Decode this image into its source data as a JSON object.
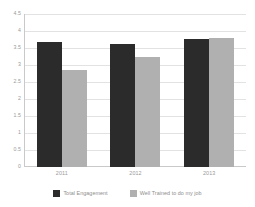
{
  "chart_data": {
    "type": "bar",
    "title": "",
    "subtitle": "",
    "xlabel": "",
    "ylabel": "",
    "categories": [
      "2011",
      "2012",
      "2013"
    ],
    "series": [
      {
        "name": "Total Engagement",
        "color": "#2b2b2b",
        "values": [
          3.67,
          3.63,
          3.76
        ]
      },
      {
        "name": "Well Trained to do my job",
        "color": "#b0b0b0",
        "values": [
          2.85,
          3.25,
          3.8
        ]
      }
    ],
    "ylim": [
      0,
      4.5
    ],
    "ytick_step": 0.5,
    "ytick_labels": [
      "4.5",
      "4",
      "3.5",
      "3",
      "2.5",
      "2",
      "1.5",
      "1",
      "0.5",
      "0"
    ],
    "ytick_values": [
      4.5,
      4,
      3.5,
      3,
      2.5,
      2,
      1.5,
      1,
      0.5,
      0
    ],
    "grid": true,
    "grid_axis": "y",
    "legend_position": "bottom",
    "bar_gap_within_group": 0,
    "axis_color": "#c9c9c9",
    "grid_color": "#e2e2e2",
    "background": "#ffffff"
  },
  "legend": {
    "items": [
      {
        "label": "Total Engagement",
        "color": "#2b2b2b"
      },
      {
        "label": "Well Trained to do my job",
        "color": "#b0b0b0"
      }
    ]
  }
}
